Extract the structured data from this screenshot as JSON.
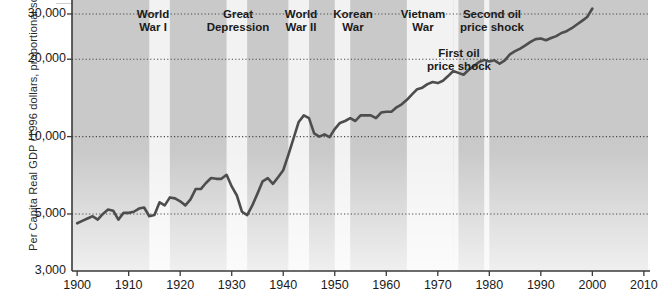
{
  "chart_data": {
    "type": "line",
    "title": "",
    "xlabel": "",
    "ylabel": "Per Capita Real GDP (1996 dollars, proportional scale)",
    "scale": "log",
    "xlim": [
      1899,
      2010.8
    ],
    "ylim": [
      3000,
      34000
    ],
    "grid": "horizontal dotted gridlines at y tick values",
    "legend": "none",
    "yticks": [
      {
        "value": 30000,
        "label": "30,000"
      },
      {
        "value": 20000,
        "label": "20,000"
      },
      {
        "value": 10000,
        "label": "10,000"
      },
      {
        "value": 5000,
        "label": "5,000"
      },
      {
        "value": 3000,
        "label": "3,000"
      }
    ],
    "xticks": [
      {
        "value": 1900,
        "label": "1900"
      },
      {
        "value": 1910,
        "label": "1910"
      },
      {
        "value": 1920,
        "label": "1920"
      },
      {
        "value": 1930,
        "label": "1930"
      },
      {
        "value": 1940,
        "label": "1940"
      },
      {
        "value": 1950,
        "label": "1950"
      },
      {
        "value": 1960,
        "label": "1960"
      },
      {
        "value": 1970,
        "label": "1970"
      },
      {
        "value": 1980,
        "label": "1980"
      },
      {
        "value": 1990,
        "label": "1990"
      },
      {
        "value": 2000,
        "label": "2000"
      },
      {
        "value": 2010,
        "label": "2010"
      }
    ],
    "series": [
      {
        "name": "Per Capita Real GDP",
        "color": "#4d4d4d",
        "x": [
          1900,
          1901,
          1902,
          1903,
          1904,
          1905,
          1906,
          1907,
          1908,
          1909,
          1910,
          1911,
          1912,
          1913,
          1914,
          1915,
          1916,
          1917,
          1918,
          1919,
          1920,
          1921,
          1922,
          1923,
          1924,
          1925,
          1926,
          1927,
          1928,
          1929,
          1930,
          1931,
          1932,
          1933,
          1934,
          1935,
          1936,
          1937,
          1938,
          1939,
          1940,
          1941,
          1942,
          1943,
          1944,
          1945,
          1946,
          1947,
          1948,
          1949,
          1950,
          1951,
          1952,
          1953,
          1954,
          1955,
          1956,
          1957,
          1958,
          1959,
          1960,
          1961,
          1962,
          1963,
          1964,
          1965,
          1966,
          1967,
          1968,
          1969,
          1970,
          1971,
          1972,
          1973,
          1974,
          1975,
          1976,
          1977,
          1978,
          1979,
          1980,
          1981,
          1982,
          1983,
          1984,
          1985,
          1986,
          1987,
          1988,
          1989,
          1990,
          1991,
          1992,
          1993,
          1994,
          1995,
          1996,
          1997,
          1998,
          1999,
          2000
        ],
        "y": [
          4600,
          4700,
          4800,
          4900,
          4750,
          5000,
          5200,
          5150,
          4750,
          5050,
          5050,
          5100,
          5250,
          5300,
          4900,
          4950,
          5550,
          5400,
          5800,
          5750,
          5600,
          5400,
          5700,
          6250,
          6250,
          6600,
          6900,
          6850,
          6850,
          7100,
          6400,
          5900,
          5100,
          4950,
          5400,
          6000,
          6700,
          6900,
          6550,
          6950,
          7400,
          8500,
          9850,
          11400,
          12100,
          11800,
          10300,
          10000,
          10200,
          9950,
          10700,
          11300,
          11500,
          11800,
          11500,
          12100,
          12100,
          12100,
          11800,
          12400,
          12500,
          12500,
          13000,
          13350,
          13900,
          14600,
          15300,
          15500,
          16000,
          16300,
          16150,
          16500,
          17200,
          18000,
          17700,
          17400,
          18200,
          18800,
          19500,
          19850,
          19600,
          19800,
          19200,
          19800,
          20900,
          21500,
          22000,
          22650,
          23350,
          23950,
          24100,
          23700,
          24200,
          24600,
          25300,
          25700,
          26400,
          27300,
          28200,
          29200,
          31500
        ]
      }
    ],
    "shaded_bands": [
      {
        "name": "World War I",
        "start": 1914,
        "end": 1918
      },
      {
        "name": "Great Depression",
        "start": 1929,
        "end": 1933
      },
      {
        "name": "World War II",
        "start": 1941,
        "end": 1945
      },
      {
        "name": "Korean War",
        "start": 1950,
        "end": 1953
      },
      {
        "name": "Vietnam War",
        "start": 1964,
        "end": 1973
      },
      {
        "name": "First oil price shock",
        "start": 1973,
        "end": 1974
      },
      {
        "name": "Second oil price shock",
        "start": 1979,
        "end": 1980
      }
    ],
    "annotations": [
      {
        "id": "wwi",
        "text": "World\nWar I",
        "x": 1916,
        "anchor_px": {
          "x": 153,
          "y": 8
        }
      },
      {
        "id": "great-depression",
        "text": "Great\nDepression",
        "x": 1931,
        "anchor_px": {
          "x": 238,
          "y": 8
        }
      },
      {
        "id": "wwii",
        "text": "World\nWar II",
        "x": 1943,
        "anchor_px": {
          "x": 301,
          "y": 8
        }
      },
      {
        "id": "korean-war",
        "text": "Korean\nWar",
        "x": 1952,
        "anchor_px": {
          "x": 353,
          "y": 8
        }
      },
      {
        "id": "vietnam-war",
        "text": "Vietnam\nWar",
        "x": 1969,
        "anchor_px": {
          "x": 423,
          "y": 8
        }
      },
      {
        "id": "second-oil-price-shock",
        "text": "Second oil\nprice shock",
        "x": 1980,
        "anchor_px": {
          "x": 492,
          "y": 8
        }
      },
      {
        "id": "first-oil-price-shock",
        "text": "First oil\nprice shock",
        "x": 1974,
        "anchor_px": {
          "x": 459,
          "y": 47
        }
      }
    ]
  },
  "figure": {
    "plot_bg_color": "#c9c9c9",
    "band_color": "#f2f2f2",
    "line_color": "#4d4d4d",
    "axis_color": "#3a3a3a",
    "gridline_color": "#4a4a4a",
    "text_color": "#1a1a1a"
  }
}
